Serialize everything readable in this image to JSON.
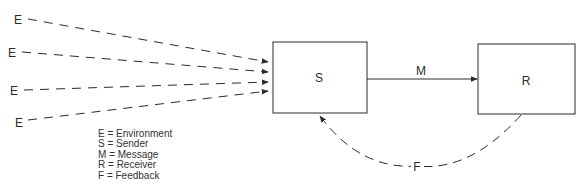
{
  "diagram": {
    "type": "communication-model",
    "nodes": [
      {
        "id": "S",
        "label": "S",
        "box": {
          "x": 273,
          "y": 42,
          "w": 94,
          "h": 71
        }
      },
      {
        "id": "R",
        "label": "R",
        "box": {
          "x": 478,
          "y": 44,
          "w": 97,
          "h": 70
        }
      }
    ],
    "environment_inputs": [
      {
        "label": "E",
        "label_pos": [
          20,
          19
        ],
        "from": [
          28,
          19
        ],
        "to": [
          268,
          62
        ]
      },
      {
        "label": "E",
        "label_pos": [
          14,
          52
        ],
        "from": [
          22,
          52
        ],
        "to": [
          268,
          72
        ]
      },
      {
        "label": "E",
        "label_pos": [
          15,
          90
        ],
        "from": [
          24,
          90
        ],
        "to": [
          268,
          82
        ]
      },
      {
        "label": "E",
        "label_pos": [
          20,
          122
        ],
        "from": [
          28,
          120
        ],
        "to": [
          268,
          91
        ]
      }
    ],
    "message_edge": {
      "label": "M",
      "from": "S",
      "to": "R",
      "style": "solid"
    },
    "feedback_edge": {
      "label": "F",
      "from": "R",
      "to": "S",
      "style": "dashed-curve"
    }
  },
  "labels": {
    "sender": "S",
    "receiver": "R",
    "message": "M",
    "feedback": "F",
    "environment": "E"
  },
  "legend": [
    {
      "key": "E",
      "sep": "=",
      "value": "Environment"
    },
    {
      "key": "S",
      "sep": "=",
      "value": "Sender"
    },
    {
      "key": "M",
      "sep": "=",
      "value": "Message"
    },
    {
      "key": "R",
      "sep": "=",
      "value": "Receiver"
    },
    {
      "key": "F",
      "sep": "=",
      "value": "Feedback"
    }
  ],
  "colors": {
    "stroke": "#2a2a2a",
    "background": "#ffffff"
  }
}
